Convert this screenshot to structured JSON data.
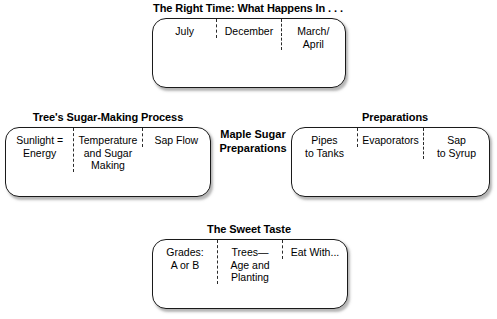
{
  "diagram": {
    "hub": {
      "label": "Maple\nSugar\nPreparations"
    },
    "groups": [
      {
        "id": "right-time",
        "title": "The Right Time: What Happens In . . .",
        "cells": [
          {
            "label": "July"
          },
          {
            "label": "December"
          },
          {
            "label": "March/\nApril"
          }
        ]
      },
      {
        "id": "sugar-making-process",
        "title": "Tree's Sugar-Making Process",
        "cells": [
          {
            "label": "Sunlight =\nEnergy"
          },
          {
            "label": "Temperature\nand Sugar\nMaking"
          },
          {
            "label": "Sap Flow"
          }
        ]
      },
      {
        "id": "preparations",
        "title": "Preparations",
        "cells": [
          {
            "label": "Pipes\nto Tanks"
          },
          {
            "label": "Evaporators"
          },
          {
            "label": "Sap\nto Syrup"
          }
        ]
      },
      {
        "id": "sweet-taste",
        "title": "The Sweet Taste",
        "cells": [
          {
            "label": "Grades:\nA or B"
          },
          {
            "label": "Trees—\nAge and\nPlanting"
          },
          {
            "label": "Eat With..."
          }
        ]
      }
    ]
  }
}
